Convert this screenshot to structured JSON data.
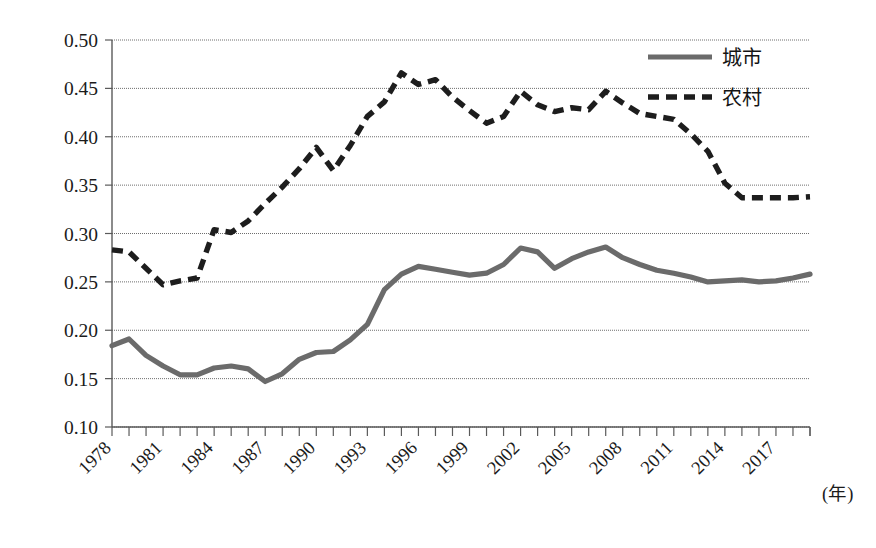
{
  "chart_data": {
    "type": "line",
    "title": "",
    "subtitle": "",
    "xlabel": "(年)",
    "ylabel": "",
    "grid": true,
    "legend_position": "top-right",
    "xlim": [
      1978,
      2019
    ],
    "ylim": [
      0.1,
      0.5
    ],
    "ytick_labels": [
      "0.50",
      "0.45",
      "0.40",
      "0.35",
      "0.30",
      "0.25",
      "0.20",
      "0.15",
      "0.10"
    ],
    "ytick_values": [
      0.5,
      0.45,
      0.4,
      0.35,
      0.3,
      0.25,
      0.2,
      0.15,
      0.1
    ],
    "xtick_labels": [
      "1978",
      "1981",
      "1984",
      "1987",
      "1990",
      "1993",
      "1996",
      "1999",
      "2002",
      "2005",
      "2008",
      "2011",
      "2014",
      "2017"
    ],
    "xtick_values": [
      1978,
      1981,
      1984,
      1987,
      1990,
      1993,
      1996,
      1999,
      2002,
      2005,
      2008,
      2011,
      2014,
      2017
    ],
    "x": [
      1978,
      1979,
      1980,
      1981,
      1982,
      1983,
      1984,
      1985,
      1986,
      1987,
      1988,
      1989,
      1990,
      1991,
      1992,
      1993,
      1994,
      1995,
      1996,
      1997,
      1998,
      1999,
      2000,
      2001,
      2002,
      2003,
      2004,
      2005,
      2006,
      2007,
      2008,
      2009,
      2010,
      2011,
      2012,
      2013,
      2014,
      2015,
      2016,
      2017,
      2018,
      2019
    ],
    "series": [
      {
        "name": "城市",
        "style": "solid",
        "color": "#6b6b6b",
        "values": [
          0.184,
          0.191,
          0.174,
          0.163,
          0.154,
          0.154,
          0.161,
          0.163,
          0.16,
          0.147,
          0.155,
          0.17,
          0.177,
          0.178,
          0.19,
          0.206,
          0.242,
          0.258,
          0.266,
          0.263,
          0.26,
          0.257,
          0.259,
          0.268,
          0.285,
          0.281,
          0.264,
          0.274,
          0.281,
          0.286,
          0.275,
          0.268,
          0.262,
          0.259,
          0.255,
          0.25,
          0.251,
          0.252,
          0.25,
          0.251,
          0.254,
          0.258
        ]
      },
      {
        "name": "农村",
        "style": "dashed",
        "color": "#1d1d1d",
        "values": [
          0.283,
          0.281,
          0.264,
          0.247,
          0.251,
          0.254,
          0.304,
          0.301,
          0.313,
          0.331,
          0.348,
          0.367,
          0.389,
          0.365,
          0.391,
          0.421,
          0.436,
          0.466,
          0.454,
          0.459,
          0.441,
          0.427,
          0.414,
          0.421,
          0.447,
          0.433,
          0.426,
          0.43,
          0.428,
          0.447,
          0.435,
          0.424,
          0.421,
          0.418,
          0.403,
          0.385,
          0.352,
          0.337,
          0.337,
          0.337,
          0.337,
          0.338
        ]
      }
    ]
  },
  "legend": {
    "entries": [
      {
        "label": "城市"
      },
      {
        "label": "农村"
      }
    ]
  },
  "axis": {
    "x_unit": "(年)"
  }
}
